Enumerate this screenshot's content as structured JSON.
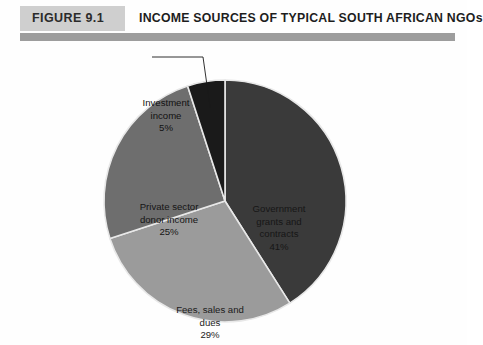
{
  "header": {
    "figure_badge": "FIGURE 9.1",
    "title": "INCOME SOURCES OF TYPICAL SOUTH AFRICAN NGOs",
    "badge_color": "#cfcfcf",
    "rule_color": "#9d9d9d"
  },
  "chart_data": {
    "type": "pie",
    "title": "INCOME SOURCES OF TYPICAL SOUTH AFRICAN NGOs",
    "xlabel": "",
    "ylabel": "",
    "legend": "none",
    "grid": false,
    "start_angle_deg": 0,
    "direction": "clockwise",
    "categories": [
      "Government grants and contracts",
      "Fees, sales and dues",
      "Private sector donor income",
      "Investment income"
    ],
    "values": [
      41,
      29,
      25,
      5
    ],
    "unit": "%",
    "colors": [
      "#3a3a3a",
      "#9b9b9b",
      "#6e6e6e",
      "#1a1a1a"
    ],
    "slices": [
      {
        "name_line1": "Government",
        "name_line2": "grants and",
        "name_line3": "contracts",
        "value_label": "41%",
        "value": 41,
        "color": "#3a3a3a",
        "label_color": "#161616"
      },
      {
        "name_line1": "Fees, sales and",
        "name_line2": "dues",
        "name_line3": "",
        "value_label": "29%",
        "value": 29,
        "color": "#9b9b9b",
        "label_color": "#1a1a1a"
      },
      {
        "name_line1": "Private sector",
        "name_line2": "donor income",
        "name_line3": "",
        "value_label": "25%",
        "value": 25,
        "color": "#6e6e6e",
        "label_color": "#151515"
      },
      {
        "name_line1": "Investment",
        "name_line2": "income",
        "name_line3": "",
        "value_label": "5%",
        "value": 5,
        "color": "#1a1a1a",
        "label_color": "#111111"
      }
    ]
  }
}
